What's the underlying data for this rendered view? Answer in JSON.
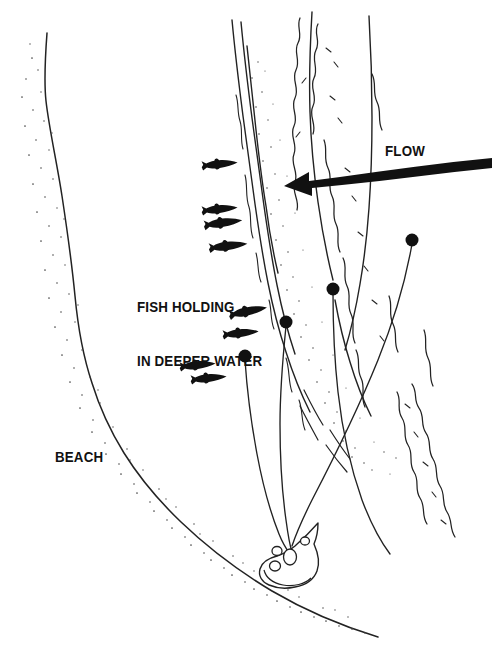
{
  "diagram": {
    "type": "illustration",
    "orientation": "overhead / plan view",
    "colors": {
      "ink": "#111111",
      "line": "#222222",
      "stipple": "#4a4a4a",
      "background": "#ffffff"
    }
  },
  "labels": {
    "fish_holding": "FISH HOLDING\nIN DEEPER WATER",
    "fish_holding_line1": "FISH HOLDING",
    "fish_holding_line2": "IN DEEPER WATER",
    "beach": "BEACH",
    "flow": "FLOW"
  },
  "features": {
    "flow_arrow": {
      "name": "flow-arrow",
      "direction": "left",
      "description": "thick tapered arrow indicating current direction"
    },
    "boat": {
      "name": "boat",
      "description": "small boat with angler seen from above",
      "x": 291,
      "y": 556
    },
    "beach_shore": {
      "name": "beach-shoreline",
      "description": "stippled sand shoreline along left and bottom"
    },
    "deep_channel": {
      "name": "deep-water-channel",
      "description": "narrow deeper water seam where fish hold"
    },
    "riffle": {
      "name": "riffle-current-lines",
      "description": "wavy broken lines showing moving water"
    }
  },
  "fish": [
    {
      "name": "fish-1",
      "x": 227,
      "y": 165,
      "len": 26,
      "facing": "right"
    },
    {
      "name": "fish-2",
      "x": 227,
      "y": 210,
      "len": 26,
      "facing": "right"
    },
    {
      "name": "fish-3",
      "x": 231,
      "y": 224,
      "len": 28,
      "facing": "right"
    },
    {
      "name": "fish-4",
      "x": 236,
      "y": 247,
      "len": 28,
      "facing": "right"
    },
    {
      "name": "fish-5",
      "x": 256,
      "y": 313,
      "len": 28,
      "facing": "right"
    },
    {
      "name": "fish-6",
      "x": 249,
      "y": 334,
      "len": 26,
      "facing": "right"
    },
    {
      "name": "fish-7",
      "x": 206,
      "y": 366,
      "len": 26,
      "facing": "right"
    },
    {
      "name": "fish-8",
      "x": 217,
      "y": 379,
      "len": 26,
      "facing": "right"
    }
  ],
  "cast_lines": [
    {
      "name": "cast-line-1",
      "bobber_x": 412,
      "bobber_y": 240,
      "bobber_r": 6.5
    },
    {
      "name": "cast-line-2",
      "bobber_x": 333,
      "bobber_y": 289,
      "bobber_r": 6.5
    },
    {
      "name": "cast-line-3",
      "bobber_x": 286,
      "bobber_y": 322,
      "bobber_r": 6.5
    },
    {
      "name": "cast-line-4",
      "bobber_x": 245,
      "bobber_y": 356,
      "bobber_r": 6.5
    }
  ]
}
